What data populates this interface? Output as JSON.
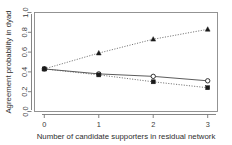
{
  "chart_data": {
    "type": "line",
    "title": "",
    "subtitle": "",
    "xlabel": "Number of candidate supporters in residual network",
    "ylabel": "Agreement probability in dyad",
    "x": [
      0,
      1,
      2,
      3
    ],
    "xticklabels": [
      "0",
      "1",
      "2",
      "3"
    ],
    "yticklabels": [
      "0.0",
      "0.2",
      "0.4",
      "0.6",
      "0.8",
      "1.0"
    ],
    "yticks": [
      0.0,
      0.2,
      0.4,
      0.6,
      0.8,
      1.0
    ],
    "xlim": [
      -0.18,
      3.18
    ],
    "ylim": [
      0.0,
      1.0
    ],
    "grid": false,
    "legend": "none",
    "series": [
      {
        "name": "rising-series",
        "marker": "filled-triangle",
        "linestyle": "dotted",
        "color": "#1a1a1a",
        "values": [
          0.43,
          0.59,
          0.73,
          0.83
        ]
      },
      {
        "name": "open-circle-series",
        "marker": "open-circle",
        "linestyle": "solid",
        "color": "#1f1f1f",
        "values": [
          0.43,
          0.38,
          0.355,
          0.31
        ]
      },
      {
        "name": "filled-square-series",
        "marker": "filled-square",
        "linestyle": "dotted",
        "color": "#1a1a1a",
        "values": [
          0.43,
          0.37,
          0.3,
          0.24
        ]
      }
    ]
  },
  "axes": {
    "x_tick_0": "0",
    "x_tick_1": "1",
    "x_tick_2": "2",
    "x_tick_3": "3",
    "y_tick_0": "0.0",
    "y_tick_1": "0.2",
    "y_tick_2": "0.4",
    "y_tick_3": "0.6",
    "y_tick_4": "0.8",
    "y_tick_5": "1.0",
    "x_title": "Number of candidate supporters in residual network",
    "y_title": "Agreement probability in dyad"
  }
}
